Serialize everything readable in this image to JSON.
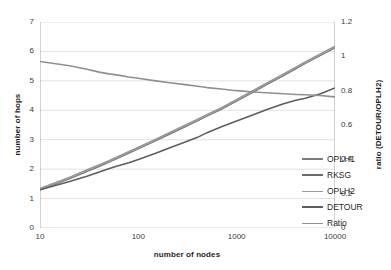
{
  "chart_data": {
    "type": "line",
    "title": "",
    "xlabel": "number of nodes",
    "ylabel": "number of hops",
    "ylabel_secondary": "ratio (DETOUR/OPLH2)",
    "xscale": "log",
    "xlim": [
      10,
      10000
    ],
    "ylim": [
      0,
      7
    ],
    "ylim_secondary": [
      0,
      1.2
    ],
    "xticks": [
      "10",
      "100",
      "1000",
      "10000"
    ],
    "xtick_values": [
      10,
      100,
      1000,
      10000
    ],
    "yticks": [
      "0",
      "1",
      "2",
      "3",
      "4",
      "5",
      "6",
      "7"
    ],
    "ytick_values": [
      0,
      1,
      2,
      3,
      4,
      5,
      6,
      7
    ],
    "yticks_secondary": [
      "0",
      "0.2",
      "0.4",
      "0.6",
      "0.8",
      "1",
      "1.2"
    ],
    "ytick_values_secondary": [
      0,
      0.2,
      0.4,
      0.6,
      0.8,
      1.0,
      1.2
    ],
    "grid": true,
    "legend_position": "center right (inside plot)",
    "x": [
      10,
      20,
      30,
      40,
      50,
      60,
      80,
      100,
      150,
      200,
      300,
      400,
      500,
      700,
      1000,
      1500,
      2000,
      3000,
      4000,
      5000,
      7000,
      10000
    ],
    "series": [
      {
        "name": "OPLH1",
        "axis": "left",
        "color": "#7b7b7b",
        "width": 2.2,
        "values": [
          1.32,
          1.7,
          1.95,
          2.12,
          2.26,
          2.38,
          2.57,
          2.72,
          2.99,
          3.19,
          3.47,
          3.67,
          3.83,
          4.06,
          4.34,
          4.66,
          4.89,
          5.21,
          5.44,
          5.62,
          5.88,
          6.15
        ]
      },
      {
        "name": "RKSG",
        "axis": "left",
        "color": "#6a6a6a",
        "width": 2.2,
        "values": [
          1.31,
          1.69,
          1.94,
          2.11,
          2.25,
          2.37,
          2.56,
          2.71,
          2.98,
          3.18,
          3.46,
          3.66,
          3.82,
          4.05,
          4.33,
          4.65,
          4.88,
          5.2,
          5.43,
          5.61,
          5.87,
          6.14
        ]
      },
      {
        "name": "OPLH2",
        "axis": "left",
        "color": "#9a9a9a",
        "width": 2.2,
        "values": [
          1.33,
          1.71,
          1.96,
          2.13,
          2.27,
          2.39,
          2.58,
          2.73,
          3.0,
          3.2,
          3.48,
          3.68,
          3.84,
          4.07,
          4.35,
          4.67,
          4.9,
          5.22,
          5.45,
          5.63,
          5.89,
          6.16
        ]
      },
      {
        "name": "DETOUR",
        "axis": "left",
        "color": "#5d5d5d",
        "width": 1.6,
        "values": [
          1.3,
          1.58,
          1.76,
          1.9,
          2.01,
          2.1,
          2.22,
          2.33,
          2.54,
          2.7,
          2.92,
          3.08,
          3.24,
          3.44,
          3.64,
          3.86,
          4.02,
          4.22,
          4.34,
          4.41,
          4.55,
          4.76
        ]
      },
      {
        "name": "Ratio",
        "axis": "right",
        "color": "#8f8f8f",
        "width": 1.6,
        "values": [
          0.97,
          0.945,
          0.925,
          0.908,
          0.898,
          0.892,
          0.88,
          0.872,
          0.857,
          0.848,
          0.835,
          0.826,
          0.818,
          0.81,
          0.8,
          0.792,
          0.788,
          0.782,
          0.778,
          0.776,
          0.772,
          0.764
        ]
      }
    ],
    "legend": [
      {
        "label": "OPLH1",
        "color": "#7b7b7b",
        "width": 2.4
      },
      {
        "label": "RKSG",
        "color": "#6a6a6a",
        "width": 2.6
      },
      {
        "label": "OPLH2",
        "color": "#9a9a9a",
        "width": 1.8
      },
      {
        "label": "DETOUR",
        "color": "#5d5d5d",
        "width": 2.6
      },
      {
        "label": "Ratio",
        "color": "#8f8f8f",
        "width": 1.8
      }
    ],
    "colors": {
      "background": "#ffffff",
      "grid": "#d4d4d4",
      "axis": "#9b9b9b",
      "text": "#1f1f1f"
    }
  }
}
